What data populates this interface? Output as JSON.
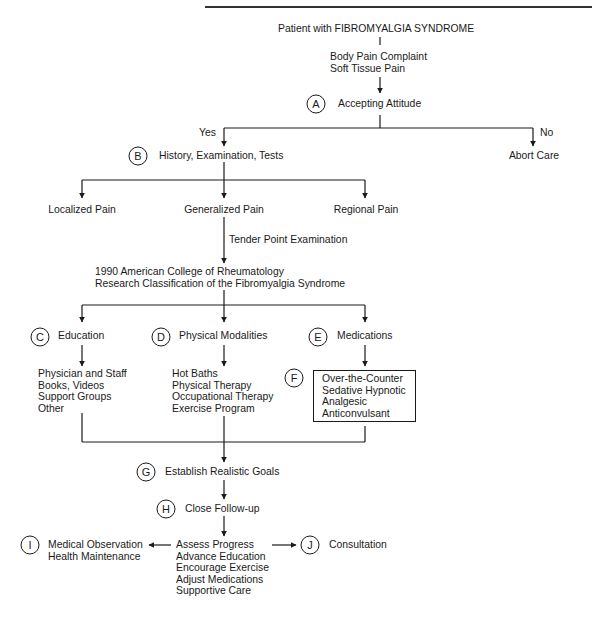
{
  "header": {
    "cut_text": "FIBROMYALGIA SYNDROME"
  },
  "flowchart": {
    "start": "Patient with FIBROMYALGIA SYNDROME",
    "complaint": [
      "Body Pain Complaint",
      "Soft Tissue Pain"
    ],
    "nodes": {
      "A": {
        "letter": "A",
        "label": "Accepting Attitude"
      },
      "B": {
        "letter": "B",
        "label": "History, Examination, Tests"
      },
      "C": {
        "letter": "C",
        "label": "Education"
      },
      "D": {
        "letter": "D",
        "label": "Physical Modalities"
      },
      "E": {
        "letter": "E",
        "label": "Medications"
      },
      "F": {
        "letter": "F"
      },
      "G": {
        "letter": "G",
        "label": "Establish Realistic Goals"
      },
      "H": {
        "letter": "H",
        "label": "Close Follow-up"
      },
      "I": {
        "letter": "I",
        "lines": [
          "Medical Observation",
          "Health Maintenance"
        ]
      },
      "J": {
        "letter": "J",
        "label": "Consultation"
      }
    },
    "yes_label": "Yes",
    "no_label": "No",
    "abort": "Abort Care",
    "pain_types": [
      "Localized Pain",
      "Generalized Pain",
      "Regional Pain"
    ],
    "tender_point": "Tender Point Examination",
    "acr": [
      "1990 American College of Rheumatology",
      "Research Classification of the Fibromyalgia Syndrome"
    ],
    "education_items": [
      "Physician and Staff",
      "Books, Videos",
      "Support Groups",
      "Other"
    ],
    "physical_items": [
      "Hot Baths",
      "Physical Therapy",
      "Occupational Therapy",
      "Exercise Program"
    ],
    "medication_items": [
      "Over-the-Counter",
      "Sedative Hypnotic",
      "Analgesic",
      "Anticonvulsant"
    ],
    "followup_items": [
      "Assess Progress",
      "Advance Education",
      "Encourage Exercise",
      "Adjust Medications",
      "Supportive Care"
    ]
  }
}
